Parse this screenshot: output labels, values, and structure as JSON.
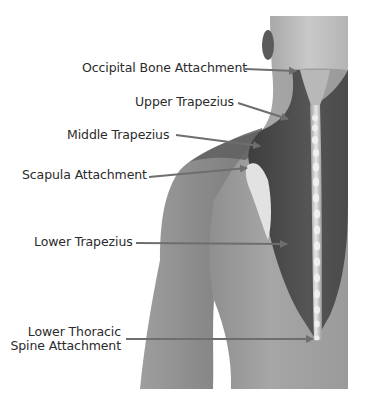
{
  "figure": {
    "colors": {
      "background": "#ffffff",
      "skin_light": "#bdbdbd",
      "skin_mid": "#9a9a9a",
      "muscle_dark": "#4a4a4a",
      "spine_highlight": "#e6e6e6",
      "arrow": "#6e6e6e",
      "text": "#2b2b2b"
    }
  },
  "labels": [
    {
      "id": "occipital",
      "text": "Occipital Bone Attachment"
    },
    {
      "id": "upper",
      "text": "Upper Trapezius"
    },
    {
      "id": "middle",
      "text": "Middle Trapezius"
    },
    {
      "id": "scapula",
      "text": "Scapula Attachment"
    },
    {
      "id": "lower",
      "text": "Lower Trapezius"
    },
    {
      "id": "thoracic",
      "line1": "Lower Thoracic",
      "line2": "Spine Attachment"
    }
  ]
}
